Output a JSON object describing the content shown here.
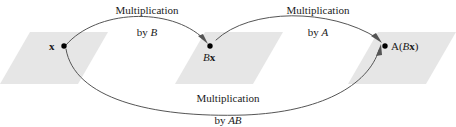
{
  "figure": {
    "background_color": "#ffffff",
    "plane_fill": "#e6e6e6",
    "curve_color": "#555555",
    "text_color": "#1a1a1a"
  },
  "planes": [
    {
      "name": "domain-plane",
      "label": ""
    },
    {
      "name": "intermediate-plane",
      "label": ""
    },
    {
      "name": "codomain-plane",
      "label": ""
    }
  ],
  "points": [
    {
      "id": "x",
      "label_main": "x",
      "label_sub": "",
      "style": "bold"
    },
    {
      "id": "Bx",
      "label_italic": "B",
      "label_bold": "x"
    },
    {
      "id": "ABx",
      "label_open": "A(",
      "label_italic": "B",
      "label_bold": "x",
      "label_close": ")"
    }
  ],
  "arrows": [
    {
      "id": "arrow-b",
      "from": "x",
      "to": "Bx",
      "line1": "Multiplication",
      "line2_prefix": "by ",
      "line2_matrix": "B"
    },
    {
      "id": "arrow-a",
      "from": "Bx",
      "to": "ABx",
      "line1": "Multiplication",
      "line2_prefix": "by ",
      "line2_matrix": "A"
    },
    {
      "id": "arrow-ab",
      "from": "x",
      "to": "ABx",
      "line1": "Multiplication",
      "line2_prefix": "by ",
      "line2_matrix": "AB"
    }
  ]
}
